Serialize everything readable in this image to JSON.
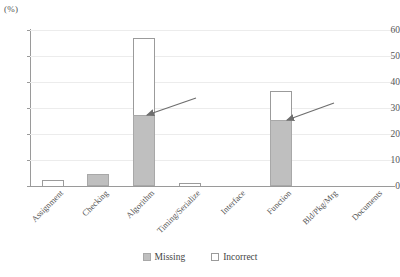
{
  "chart_data": {
    "type": "bar",
    "stacked": true,
    "title": "",
    "subtitle": "",
    "xlabel": "",
    "ylabel": "(%)",
    "unit_label": "(%)",
    "ylim": [
      0,
      60
    ],
    "ytick_step": 10,
    "yticks": [
      0,
      10,
      20,
      30,
      40,
      50,
      60
    ],
    "ytick_labels": [
      "0",
      "10",
      "20",
      "30",
      "40",
      "50",
      "60"
    ],
    "grid": true,
    "grid_axis": "y",
    "legend_position": "bottom",
    "categories": [
      "Assignment",
      "Checking",
      "Algorithm",
      "Timing/Serialize",
      "Interface",
      "Function",
      "Bld/Pkg/Mrg",
      "Documents"
    ],
    "series": [
      {
        "name": "Missing",
        "color": "#bfbfbf",
        "values": [
          0,
          4.5,
          27.5,
          0,
          0,
          25.5,
          0,
          0
        ]
      },
      {
        "name": "Incorrect",
        "color": "#ffffff",
        "values": [
          2.5,
          0,
          29.5,
          1.2,
          0,
          11.0,
          0,
          0
        ]
      }
    ],
    "totals": [
      2.5,
      4.5,
      57.0,
      1.2,
      0,
      36.5,
      0,
      0
    ],
    "annotations": [
      {
        "name": "arrow-algorithm",
        "target_category": "Algorithm",
        "target_value": 27.5,
        "text": "",
        "tip": [
          147,
          115
        ],
        "tail": [
          196,
          98
        ]
      },
      {
        "name": "arrow-function",
        "target_category": "Function",
        "target_value": 25.5,
        "text": "",
        "tip": [
          287,
          120
        ],
        "tail": [
          334,
          103
        ]
      }
    ]
  },
  "legend": {
    "items": [
      {
        "label": "Missing",
        "swatch": "filled-gray-swatch"
      },
      {
        "label": "Incorrect",
        "swatch": "outlined-white-swatch"
      }
    ]
  }
}
